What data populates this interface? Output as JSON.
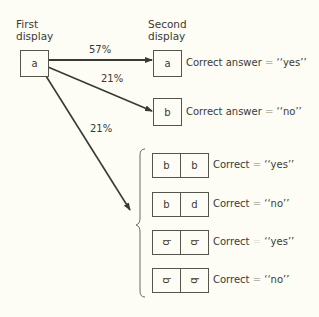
{
  "headings": {
    "first_line1": "First",
    "first_line2": "display",
    "second_line1": "Second",
    "second_line2": "display"
  },
  "first_display": {
    "letter": "a"
  },
  "paths": [
    {
      "percent": "57%",
      "target": "second-a"
    },
    {
      "percent": "21%",
      "target": "second-b"
    },
    {
      "percent": "21%",
      "target": "pairs-group"
    }
  ],
  "second_display": [
    {
      "letter": "a",
      "prefix": "Correct answer",
      "eq": "=",
      "answer": "‘‘yes’’"
    },
    {
      "letter": "b",
      "prefix": "Correct answer",
      "eq": "=",
      "answer": "‘‘no’’"
    }
  ],
  "pairs": [
    {
      "left": "b",
      "right": "b",
      "prefix": "Correct",
      "eq": "=",
      "answer": "‘‘yes’’"
    },
    {
      "left": "b",
      "right": "d",
      "prefix": "Correct",
      "eq": "=",
      "answer": "‘‘no’’"
    },
    {
      "left": "b",
      "right": "b",
      "prefix": "Correct",
      "eq": "=",
      "answer": "‘‘yes’’",
      "rotated": true
    },
    {
      "left": "b",
      "right": "d",
      "prefix": "Correct",
      "eq": "=",
      "answer": "‘‘no’’",
      "rotated": true
    }
  ],
  "colors": {
    "line": "#3a3a34",
    "background": "#fdfdf6",
    "faint": "#b9b9ad"
  }
}
